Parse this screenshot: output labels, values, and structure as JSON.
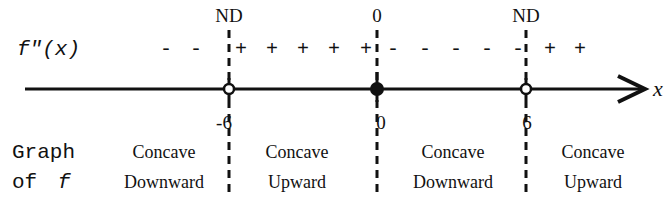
{
  "diagram": {
    "type": "sign-chart",
    "row_label": "f\"(x)",
    "axis_label": "x",
    "critical_points": [
      {
        "x": "-6",
        "top_label": "ND",
        "marker": "open"
      },
      {
        "x": "0",
        "top_label": "0",
        "marker": "filled"
      },
      {
        "x": "6",
        "top_label": "ND",
        "marker": "open"
      }
    ],
    "sign_groups": [
      {
        "interval": "x < -6",
        "signs": [
          "-",
          "-"
        ]
      },
      {
        "interval": "-6 < x < 0",
        "signs": [
          "+",
          "+",
          "+",
          "+",
          "+"
        ]
      },
      {
        "interval": "0 < x < 6",
        "signs": [
          "-",
          "-",
          "-",
          "-",
          "-"
        ]
      },
      {
        "interval": "x > 6",
        "signs": [
          "+",
          "+"
        ]
      }
    ],
    "graph_label_line1": "Graph",
    "graph_label_line2_prefix": "of",
    "graph_label_line2_f": "f",
    "concavity": [
      {
        "line1": "Concave",
        "line2": "Downward"
      },
      {
        "line1": "Concave",
        "line2": "Upward"
      },
      {
        "line1": "Concave",
        "line2": "Downward"
      },
      {
        "line1": "Concave",
        "line2": "Upward"
      }
    ]
  }
}
